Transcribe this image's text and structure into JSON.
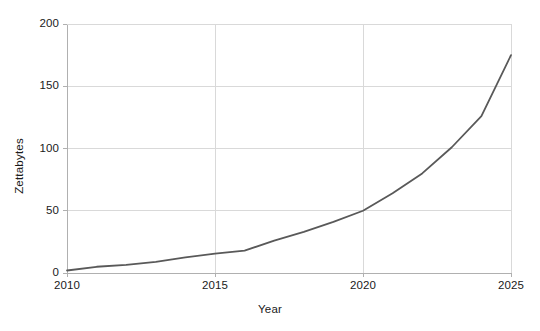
{
  "chart_data": {
    "type": "line",
    "title": "",
    "subtitle": "",
    "xlabel": "Year",
    "ylabel": "Zettabytes",
    "x": [
      2010,
      2011,
      2012,
      2013,
      2014,
      2015,
      2016,
      2017,
      2018,
      2019,
      2020,
      2021,
      2022,
      2023,
      2024,
      2025
    ],
    "series": [
      {
        "name": "Global data volume",
        "values": [
          2,
          5,
          6.5,
          9,
          12.5,
          15.5,
          18,
          26,
          33,
          41,
          50,
          64,
          80,
          101,
          126,
          175
        ],
        "color": "#595959",
        "line_width": 1.8
      }
    ],
    "xlim": [
      2010,
      2025
    ],
    "ylim": [
      0,
      200
    ],
    "xticks": [
      2010,
      2015,
      2020,
      2025
    ],
    "xtick_labels": [
      "2010",
      "2015",
      "2020",
      "2025"
    ],
    "yticks": [
      0,
      50,
      100,
      150,
      200
    ],
    "ytick_labels": [
      "0",
      "50",
      "100",
      "150",
      "200"
    ],
    "grid": true,
    "grid_color": "#d9d9d9",
    "axis_color": "#b0b0b0",
    "legend": null,
    "legend_position": "none",
    "background": "#ffffff"
  },
  "plot_geometry": {
    "left": 67,
    "right": 511,
    "top": 24,
    "bottom": 273
  }
}
